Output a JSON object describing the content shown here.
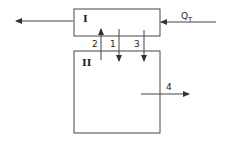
{
  "diagram": {
    "boxes": [
      {
        "id": "box-I",
        "label": "I"
      },
      {
        "id": "box-II",
        "label": "II"
      }
    ],
    "flows": [
      {
        "id": "flow-out-left",
        "label": "",
        "direction": "left"
      },
      {
        "id": "flow-QT",
        "label": "Q",
        "subscript": "T",
        "direction": "left"
      },
      {
        "id": "flow-1",
        "label": "1",
        "direction": "down"
      },
      {
        "id": "flow-2",
        "label": "2",
        "direction": "up"
      },
      {
        "id": "flow-3",
        "label": "3",
        "direction": "down"
      },
      {
        "id": "flow-4",
        "label": "4",
        "direction": "right"
      }
    ],
    "stroke_color": "#333333"
  }
}
